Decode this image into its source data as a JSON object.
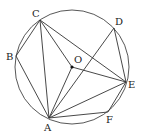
{
  "figure": {
    "type": "circle-geometry",
    "circle": {
      "center": "O",
      "cx": 72,
      "cy": 67,
      "r": 57
    },
    "points": [
      {
        "name": "A",
        "x": 49,
        "y": 118,
        "label": "A",
        "lx": 44,
        "ly": 131
      },
      {
        "name": "B",
        "x": 16,
        "y": 56,
        "label": "B",
        "lx": 6,
        "ly": 60
      },
      {
        "name": "C",
        "x": 40,
        "y": 20,
        "label": "C",
        "lx": 32,
        "ly": 17
      },
      {
        "name": "D",
        "x": 114,
        "y": 28,
        "label": "D",
        "lx": 115,
        "ly": 25
      },
      {
        "name": "E",
        "x": 126,
        "y": 82,
        "label": "E",
        "lx": 128,
        "ly": 88
      },
      {
        "name": "F",
        "x": 108,
        "y": 112,
        "label": "F",
        "lx": 106,
        "ly": 123
      },
      {
        "name": "O",
        "x": 72,
        "y": 67,
        "label": "O",
        "lx": 74,
        "ly": 63
      }
    ],
    "segments": [
      [
        "C",
        "B"
      ],
      [
        "B",
        "A"
      ],
      [
        "C",
        "A"
      ],
      [
        "C",
        "O"
      ],
      [
        "C",
        "E"
      ],
      [
        "O",
        "A"
      ],
      [
        "O",
        "E"
      ],
      [
        "A",
        "D"
      ],
      [
        "D",
        "E"
      ],
      [
        "A",
        "E"
      ],
      [
        "A",
        "F"
      ],
      [
        "F",
        "E"
      ]
    ],
    "labels": {
      "A": "A",
      "B": "B",
      "C": "C",
      "D": "D",
      "E": "E",
      "F": "F",
      "O": "O"
    }
  }
}
